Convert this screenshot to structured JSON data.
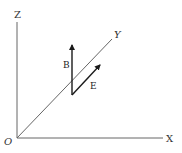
{
  "diagram": {
    "axes": {
      "z_label": "Z",
      "y_label": "Y",
      "x_label": "X",
      "origin_label": "O"
    },
    "vectors": {
      "b_label": "B",
      "e_label": "E"
    },
    "colors": {
      "axis": "#666666",
      "vector": "#1a1a1a",
      "text": "#333333"
    }
  }
}
